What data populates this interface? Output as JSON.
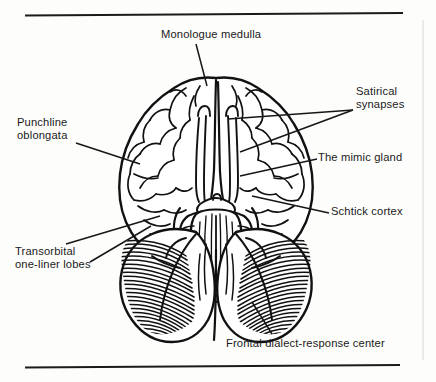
{
  "figure": {
    "kind": "anatomical-diagram",
    "style": "black-and-white line engraving with hatched cerebellum",
    "colors": {
      "ink": "#111111",
      "paper": "#fdfdfc",
      "leader_line": "#161616"
    },
    "rules": {
      "top_rule": "horizontal rule above the figure",
      "bottom_rule": "horizontal rule below the figure"
    }
  },
  "labels": [
    {
      "id": "monologue-medulla",
      "text": "Monologue medulla",
      "lines": [
        "Monologue medulla"
      ],
      "position": "top-center",
      "align": "left"
    },
    {
      "id": "satirical-synapses",
      "text": "Satirical synapses",
      "lines": [
        "Satirical",
        "synapses"
      ],
      "position": "top-right",
      "align": "left",
      "leader_count": 2
    },
    {
      "id": "the-mimic-gland",
      "text": "The mimic gland",
      "lines": [
        "The mimic gland"
      ],
      "position": "middle-right",
      "align": "left"
    },
    {
      "id": "schtick-cortex",
      "text": "Schtick cortex",
      "lines": [
        "Schtick cortex"
      ],
      "position": "lower-right",
      "align": "left"
    },
    {
      "id": "punchline-oblongata",
      "text": "Punchline oblongata",
      "lines": [
        "Punchline",
        "oblongata"
      ],
      "position": "middle-left",
      "align": "left"
    },
    {
      "id": "transorbital-one-liner-lobes",
      "text": "Transorbital one-liner lobes",
      "lines": [
        "Transorbital",
        "one-liner lobes"
      ],
      "position": "lower-left",
      "align": "left"
    },
    {
      "id": "frontal-dialect-response-center",
      "text": "Frontal dialect-response center",
      "lines": [
        "Frontal dialect-response center"
      ],
      "position": "bottom-center",
      "align": "left"
    }
  ]
}
